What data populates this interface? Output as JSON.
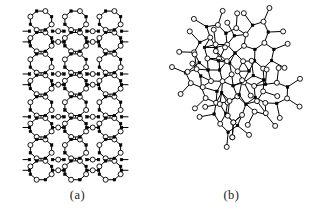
{
  "figure": {
    "background_color": "#ffffff",
    "width": 309,
    "height": 222
  },
  "style": {
    "bond_color": "#000000",
    "bond_width": 1.0,
    "open_node_fill": "#ffffff",
    "open_node_stroke": "#000000",
    "open_node_radius": 2.5,
    "open_node_stroke_width": 0.9,
    "filled_node_fill": "#000000",
    "filled_node_stroke": "#000000",
    "filled_node_size": 2.6
  },
  "legend": {
    "open_node_name": "bridging-atom-open-circle",
    "filled_node_name": "network-former-atom-filled-square"
  },
  "panels": [
    {
      "id": "a",
      "caption": "(a)",
      "kind": "crystalline-ordered-network",
      "viewbox": [
        0,
        0,
        155,
        190
      ],
      "bounds": {
        "x": 17,
        "y": 10,
        "width": 107,
        "height": 171
      },
      "lattice": {
        "type": "columnar-ring-lattice",
        "columns": 3,
        "rows": 8,
        "ring_vertices": 8,
        "column_x": [
          41,
          75.5,
          110
        ],
        "row_pitch": 21.4,
        "row_y_start": 20.5,
        "ring_radius_x": 11.5,
        "ring_radius_y": 10.2,
        "bridge_columns_x": [
          58.2,
          92.7
        ],
        "edge_stub_length": 6.5
      }
    },
    {
      "id": "b",
      "caption": "(b)",
      "kind": "amorphous-disordered-network",
      "viewbox": [
        0,
        0,
        155,
        190
      ],
      "bounds": {
        "x": 18,
        "y": 8,
        "width": 128,
        "height": 172
      },
      "random_network": {
        "type": "continuous-random-network",
        "seed": 20240517,
        "center": [
          80,
          94
        ],
        "rings_approx": 14,
        "ring_size_range": [
          5,
          8
        ],
        "mean_ring_size": 6.3,
        "relax_iterations": 420,
        "bond_length": 9.6,
        "cluster_radius_x": 64,
        "cluster_radius_y": 86
      }
    }
  ]
}
